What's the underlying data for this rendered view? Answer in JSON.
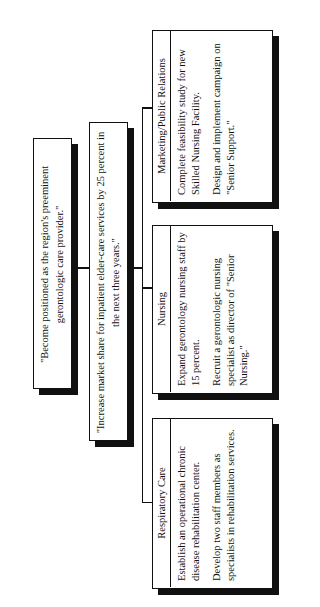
{
  "diagram": {
    "type": "hierarchy",
    "orientation": "rotated-90-counterclockwise",
    "vision": {
      "text": "\"Become positioned as the region's preeminent gerontologic care provider.\""
    },
    "goal": {
      "text": "\"Increase market share for inpatient elder-care services by 25 percent in the next three years.\""
    },
    "departments": [
      {
        "title": "Respiratory Care",
        "objectives": [
          "Establish an operational chronic disease rehabilitation center.",
          "Develop two staff members as specialists in rehabilitation services."
        ]
      },
      {
        "title": "Nursing",
        "objectives": [
          "Expand gerontology nursing staff by 15 percent.",
          "Recruit a gerontologic nursing specialist as director of \"Senior Nursing.\""
        ]
      },
      {
        "title": "Marketing/Public Relations",
        "objectives": [
          "Complete feasibility study for new Skilled Nursing Facility.",
          "Design and implement campaign on \"Senior Support.\""
        ]
      }
    ]
  }
}
